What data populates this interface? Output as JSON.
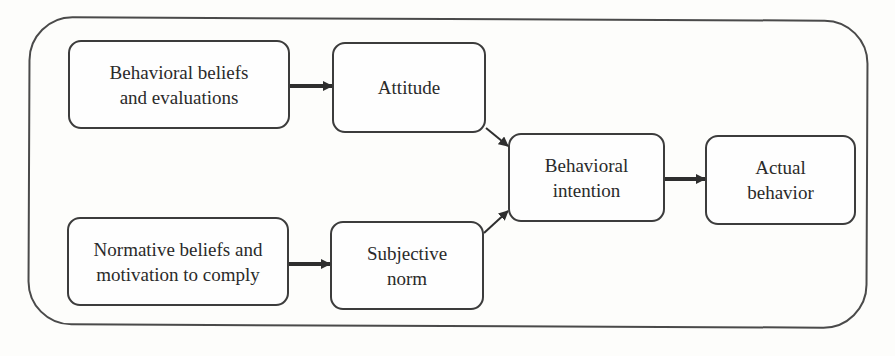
{
  "diagram": {
    "type": "flowchart",
    "title": "",
    "nodes": [
      {
        "id": "behavioral_beliefs",
        "label": "Behavioral beliefs and evaluations",
        "lines": [
          "Behavioral beliefs",
          "and evaluations"
        ]
      },
      {
        "id": "attitude",
        "label": "Attitude",
        "lines": [
          "Attitude"
        ]
      },
      {
        "id": "normative_beliefs",
        "label": "Normative beliefs and motivation to comply",
        "lines": [
          "Normative beliefs and",
          "motivation to comply"
        ]
      },
      {
        "id": "subjective_norm",
        "label": "Subjective norm",
        "lines": [
          "Subjective",
          "norm"
        ]
      },
      {
        "id": "behavioral_intention",
        "label": "Behavioral intention",
        "lines": [
          "Behavioral",
          "intention"
        ]
      },
      {
        "id": "actual_behavior",
        "label": "Actual behavior",
        "lines": [
          "Actual",
          "behavior"
        ]
      }
    ],
    "edges": [
      {
        "from": "behavioral_beliefs",
        "to": "attitude"
      },
      {
        "from": "normative_beliefs",
        "to": "subjective_norm"
      },
      {
        "from": "attitude",
        "to": "behavioral_intention"
      },
      {
        "from": "subjective_norm",
        "to": "behavioral_intention"
      },
      {
        "from": "behavioral_intention",
        "to": "actual_behavior"
      }
    ],
    "colors": {
      "stroke": "#3c3c3c",
      "background": "#fdfdfb",
      "text": "#2a2a2a"
    }
  }
}
